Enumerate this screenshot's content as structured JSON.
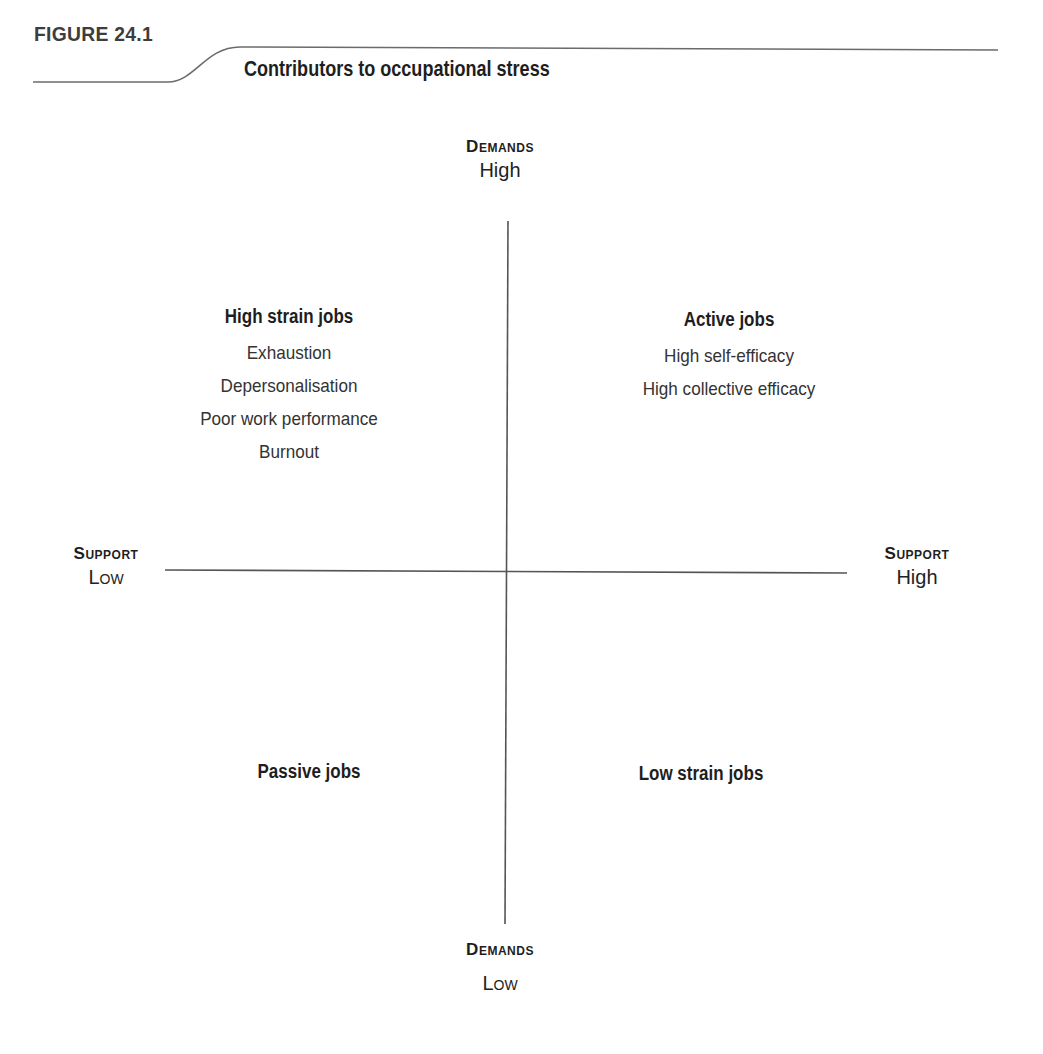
{
  "figure": {
    "label": "FIGURE 24.1",
    "title": "Contributors to occupational stress"
  },
  "axes": {
    "top": {
      "name": "Demands",
      "level": "High"
    },
    "bottom": {
      "name": "Demands",
      "level": "Low"
    },
    "left": {
      "name": "Support",
      "level": "Low"
    },
    "right": {
      "name": "Support",
      "level": "High"
    }
  },
  "quadrants": {
    "top_left": {
      "title": "High strain jobs",
      "items": [
        "Exhaustion",
        "Depersonalisation",
        "Poor work performance",
        "Burnout"
      ]
    },
    "top_right": {
      "title": "Active jobs",
      "items": [
        "High self-efficacy",
        "High collective efficacy"
      ]
    },
    "bottom_left": {
      "title": "Passive jobs",
      "items": []
    },
    "bottom_right": {
      "title": "Low strain jobs",
      "items": []
    }
  },
  "colors": {
    "line": "#555555",
    "text": "#222222"
  }
}
